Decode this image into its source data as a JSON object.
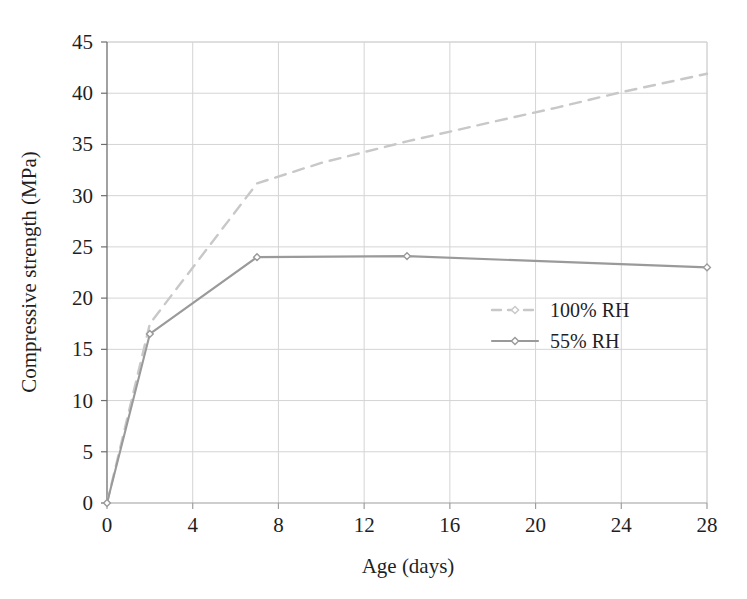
{
  "chart_data": {
    "type": "line",
    "title": "",
    "subtitle": "",
    "xlabel": "Age (days)",
    "ylabel": "Compressive strength (MPa)",
    "xlim": [
      0,
      28
    ],
    "ylim": [
      0,
      45
    ],
    "xticks": [
      0,
      4,
      8,
      12,
      16,
      20,
      24,
      28
    ],
    "yticks": [
      0,
      5,
      10,
      15,
      20,
      25,
      30,
      35,
      40,
      45
    ],
    "xtick_labels": [
      "0",
      "4",
      "8",
      "12",
      "16",
      "20",
      "24",
      "28"
    ],
    "ytick_labels": [
      "0",
      "5",
      "10",
      "15",
      "20",
      "25",
      "30",
      "35",
      "40",
      "45"
    ],
    "grid": true,
    "legend_position": "center-right",
    "series": [
      {
        "name": "100% RH",
        "style": "dashed",
        "color": "#c8c8c8",
        "marker": "diamond",
        "x": [
          0,
          2,
          7,
          10,
          14,
          18,
          21,
          24,
          28
        ],
        "values": [
          0,
          17.5,
          31.2,
          33.2,
          35.3,
          37.2,
          38.6,
          40.1,
          41.9
        ]
      },
      {
        "name": "55% RH",
        "style": "solid",
        "color": "#9a9a9a",
        "marker": "diamond",
        "x": [
          0,
          2,
          7,
          14,
          28
        ],
        "values": [
          0,
          16.5,
          24.0,
          24.1,
          23.0
        ]
      }
    ]
  },
  "legend": {
    "items": [
      {
        "label": "100% RH"
      },
      {
        "label": "55% RH"
      }
    ]
  },
  "axes": {
    "x_title": "Age (days)",
    "y_title": "Compressive strength (MPa)"
  }
}
